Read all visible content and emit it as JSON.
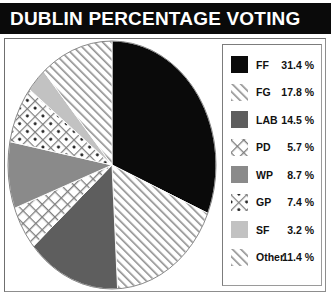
{
  "header": {
    "title": "DUBLIN PERCENTAGE VOTING",
    "background_color": "#0a0a0a",
    "text_color": "#ffffff"
  },
  "chart_data": {
    "type": "pie",
    "title": "DUBLIN PERCENTAGE VOTING",
    "xlabel": "",
    "ylabel": "",
    "units": "%",
    "start_angle_deg": 0,
    "direction": "clockwise",
    "legend_position": "right",
    "grid": false,
    "categories": [
      "FF",
      "FG",
      "LAB",
      "PD",
      "WP",
      "GP",
      "SF",
      "Other"
    ],
    "values": [
      31.4,
      17.8,
      14.5,
      5.7,
      8.7,
      7.4,
      3.2,
      11.4
    ],
    "value_labels": [
      "31.4 %",
      "17.8 %",
      "14.5 %",
      "5.7 %",
      "8.7 %",
      "7.4 %",
      "3.2 %",
      "11.4 %"
    ],
    "slices": [
      {
        "label": "FF",
        "value": 31.4,
        "value_label": "31.4 %",
        "fill": "solid-black",
        "color": "#0a0a0a"
      },
      {
        "label": "FG",
        "value": 17.8,
        "value_label": "17.8 %",
        "fill": "diagonal-hatch",
        "color": "#b4b4b4"
      },
      {
        "label": "LAB",
        "value": 14.5,
        "value_label": "14.5 %",
        "fill": "solid-dark-gray",
        "color": "#5e5e5e"
      },
      {
        "label": "PD",
        "value": 5.7,
        "value_label": "5.7 %",
        "fill": "cross-hatch",
        "color": "#9e9e9e"
      },
      {
        "label": "WP",
        "value": 8.7,
        "value_label": "8.7 %",
        "fill": "solid-medium-gray",
        "color": "#8a8a8a"
      },
      {
        "label": "GP",
        "value": 7.4,
        "value_label": "7.4 %",
        "fill": "dotted-cross-hatch",
        "color": "#9e9e9e"
      },
      {
        "label": "SF",
        "value": 3.2,
        "value_label": "3.2 %",
        "fill": "solid-light-gray",
        "color": "#c2c2c2"
      },
      {
        "label": "Other",
        "value": 11.4,
        "value_label": "11.4 %",
        "fill": "diagonal-hatch",
        "color": "#b4b4b4"
      }
    ]
  },
  "legend": {
    "items": [
      {
        "label": "FF",
        "value": "31.4 %"
      },
      {
        "label": "FG",
        "value": "17.8 %"
      },
      {
        "label": "LAB",
        "value": "14.5 %"
      },
      {
        "label": "PD",
        "value": "5.7 %"
      },
      {
        "label": "WP",
        "value": "8.7 %"
      },
      {
        "label": "GP",
        "value": "7.4 %"
      },
      {
        "label": "SF",
        "value": "3.2 %"
      },
      {
        "label": "Other",
        "value": "11.4 %"
      }
    ]
  }
}
